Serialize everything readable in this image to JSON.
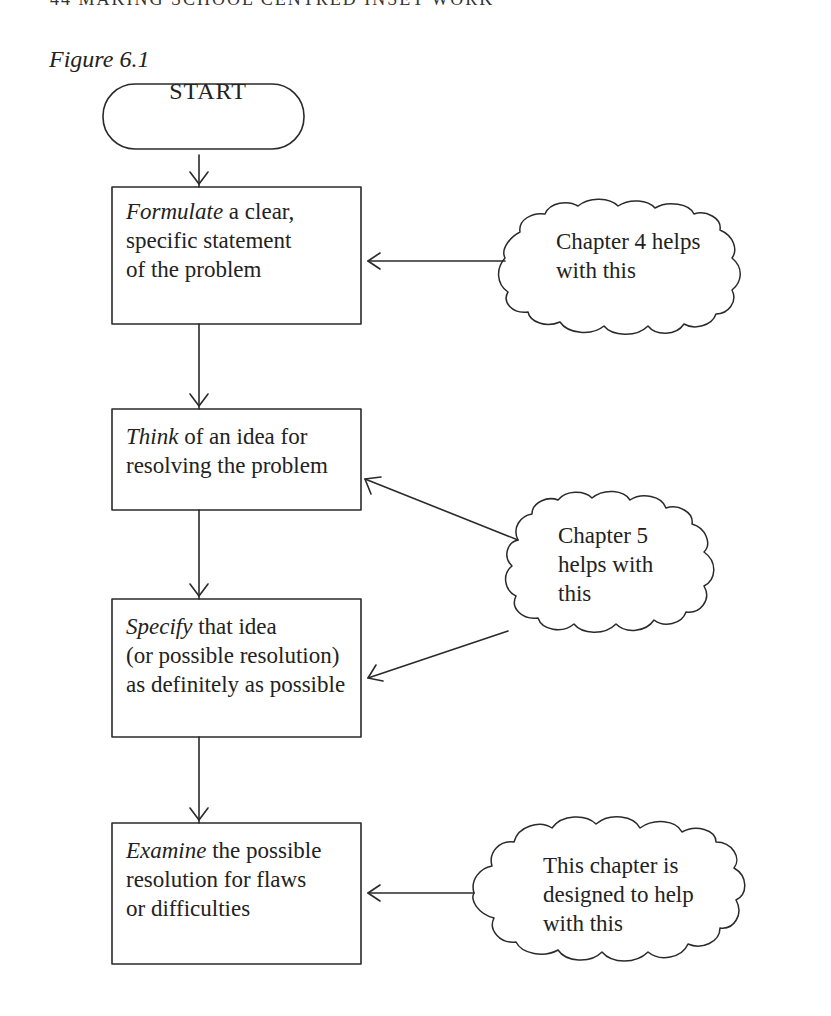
{
  "page": {
    "running_head": "44   MAKING SCHOOL CENTRED INSET WORK",
    "figure_caption": "Figure 6.1"
  },
  "flowchart": {
    "start": {
      "label": "START"
    },
    "steps": [
      {
        "emphasis": "Formulate",
        "text": " a clear,",
        "lines": [
          "specific statement",
          "of the problem"
        ]
      },
      {
        "emphasis": "Think",
        "text": " of an idea for",
        "lines": [
          "resolving the problem"
        ]
      },
      {
        "emphasis": "Specify",
        "text": " that idea",
        "lines": [
          "(or possible resolution)",
          "as definitely as possible"
        ]
      },
      {
        "emphasis": "Examine",
        "text": " the possible",
        "lines": [
          "resolution for flaws",
          "or difficulties"
        ]
      }
    ],
    "notes": [
      {
        "lines": [
          "Chapter 4 helps",
          "with this"
        ],
        "points_to": "step 1"
      },
      {
        "lines": [
          "Chapter 5",
          "helps with",
          "this"
        ],
        "points_to": "steps 2 and 3"
      },
      {
        "lines": [
          "This chapter is",
          "designed to help",
          "with this"
        ],
        "points_to": "step 4"
      }
    ]
  }
}
